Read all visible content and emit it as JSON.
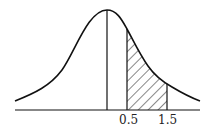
{
  "diagram": {
    "type": "normal-distribution-curve",
    "shaded_region": {
      "from": 0.5,
      "to": 1.5,
      "pattern": "diagonal-hatch"
    },
    "labels": [
      "0.5",
      "1.5"
    ],
    "colors": {
      "stroke": "#111111",
      "background": "#ffffff"
    }
  }
}
